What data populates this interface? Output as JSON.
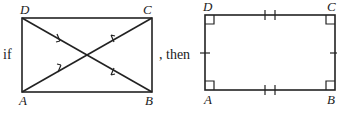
{
  "statement": {
    "prefix": "if",
    "connector": ", then"
  },
  "left_figure": {
    "description": "Parallelogram ABCD with congruent diagonals (diagonals bisect each other, single arrow-tick marks on each half)",
    "vertices": {
      "A": "A",
      "B": "B",
      "C": "C",
      "D": "D"
    },
    "diagonal_marks": "single tick on each half of both diagonals"
  },
  "right_figure": {
    "description": "Rectangle ABCD with four right angles, AB ≅ DC (double ticks), AD ≅ BC (single ticks)",
    "vertices": {
      "A": "A",
      "B": "B",
      "C": "C",
      "D": "D"
    },
    "right_angle_marks": [
      "A",
      "B",
      "C",
      "D"
    ],
    "side_marks": {
      "AB": 2,
      "DC": 2,
      "AD": 1,
      "BC": 1
    }
  },
  "colors": {
    "stroke": "#222222",
    "background": "#ffffff"
  }
}
